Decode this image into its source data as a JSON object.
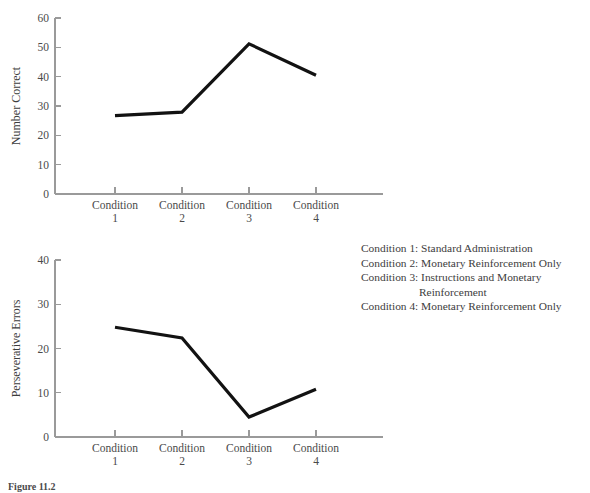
{
  "chart_data": [
    {
      "type": "line",
      "id": "number-correct",
      "title": "",
      "xlabel": "",
      "ylabel": "Number Correct",
      "categories": [
        "Condition 1",
        "Condition 2",
        "Condition 3",
        "Condition 4"
      ],
      "category_lines": [
        [
          "Condition",
          "1"
        ],
        [
          "Condition",
          "2"
        ],
        [
          "Condition",
          "3"
        ],
        [
          "Condition",
          "4"
        ]
      ],
      "values": [
        26.7,
        27.9,
        51.2,
        40.5
      ],
      "ylim": [
        0,
        60
      ],
      "yticks": [
        0,
        10,
        20,
        30,
        40,
        50,
        60
      ],
      "ytick_labels": [
        "0",
        "10",
        "20",
        "30",
        "40",
        "50",
        "60"
      ],
      "grid": false,
      "legend": "none",
      "line_color": "#121212"
    },
    {
      "type": "line",
      "id": "perseverative-errors",
      "title": "",
      "xlabel": "",
      "ylabel": "Perseverative Errors",
      "categories": [
        "Condition 1",
        "Condition 2",
        "Condition 3",
        "Condition 4"
      ],
      "category_lines": [
        [
          "Condition",
          "1"
        ],
        [
          "Condition",
          "2"
        ],
        [
          "Condition",
          "3"
        ],
        [
          "Condition",
          "4"
        ]
      ],
      "values": [
        24.8,
        22.4,
        4.5,
        10.8
      ],
      "ylim": [
        0,
        40
      ],
      "yticks": [
        0,
        10,
        20,
        30,
        40
      ],
      "ytick_labels": [
        "0",
        "10",
        "20",
        "30",
        "40"
      ],
      "grid": false,
      "legend": "none",
      "line_color": "#121212"
    }
  ],
  "legend": {
    "lines": [
      "Condition 1: Standard Administration",
      "Condition 2: Monetary Reinforcement Only",
      "Condition 3: Instructions and Monetary",
      "Reinforcement",
      "Condition 4: Monetary Reinforcement Only"
    ],
    "indented_line_index": 3
  },
  "caption": {
    "label": "Figure 11.2",
    "text": "Figure 11.2"
  },
  "colors": {
    "background": "#ffffff",
    "data_line": "#121212",
    "axis": "#9a9a9a",
    "text": "#3d3d3d"
  }
}
